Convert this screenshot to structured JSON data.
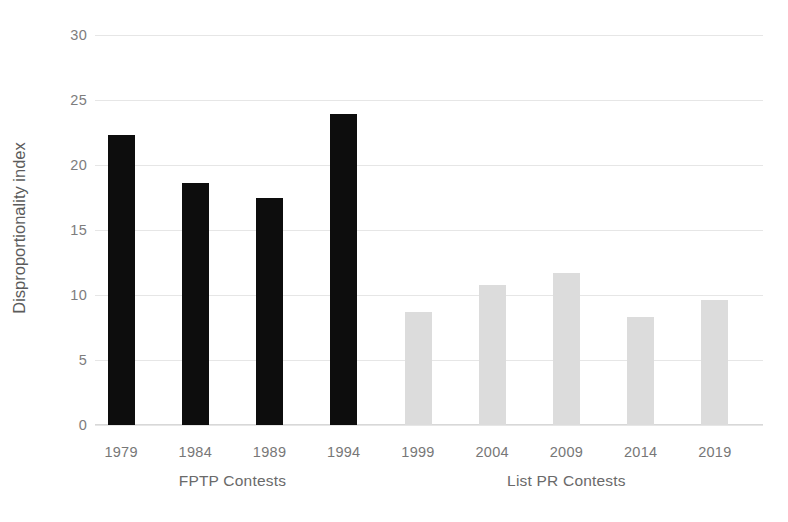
{
  "chart_data": {
    "type": "bar",
    "title": "",
    "xlabel": "",
    "ylabel": "Disproportionality index",
    "ylim": [
      0,
      30
    ],
    "ytick_labels": [
      "0",
      "5",
      "10",
      "15",
      "20",
      "25",
      "30"
    ],
    "yticks": [
      0,
      5,
      10,
      15,
      20,
      25,
      30
    ],
    "grid": true,
    "legend": "none",
    "categories": [
      "1979",
      "1984",
      "1989",
      "1994",
      "1999",
      "2004",
      "2009",
      "2014",
      "2019"
    ],
    "values": [
      22.3,
      18.6,
      17.5,
      23.9,
      8.7,
      10.8,
      11.7,
      8.3,
      9.6
    ],
    "bars": [
      {
        "category": "1979",
        "value": 22.3,
        "group": "FPTP Contests",
        "color": "#0d0d0d"
      },
      {
        "category": "1984",
        "value": 18.6,
        "group": "FPTP Contests",
        "color": "#0d0d0d"
      },
      {
        "category": "1989",
        "value": 17.5,
        "group": "FPTP Contests",
        "color": "#0d0d0d"
      },
      {
        "category": "1994",
        "value": 23.9,
        "group": "FPTP Contests",
        "color": "#0d0d0d"
      },
      {
        "category": "1999",
        "value": 8.7,
        "group": "List PR Contests",
        "color": "#dcdcdc"
      },
      {
        "category": "2004",
        "value": 10.8,
        "group": "List PR Contests",
        "color": "#dcdcdc"
      },
      {
        "category": "2009",
        "value": 11.7,
        "group": "List PR Contests",
        "color": "#dcdcdc"
      },
      {
        "category": "2014",
        "value": 8.3,
        "group": "List PR Contests",
        "color": "#dcdcdc"
      },
      {
        "category": "2019",
        "value": 9.6,
        "group": "List PR Contests",
        "color": "#dcdcdc"
      }
    ],
    "group_labels": [
      {
        "label": "FPTP Contests",
        "spans": [
          "1979",
          "1984",
          "1989",
          "1994"
        ]
      },
      {
        "label": "List PR Contests",
        "spans": [
          "1999",
          "2004",
          "2009",
          "2014",
          "2019"
        ]
      }
    ],
    "colors": {
      "fptp_bar": "#0d0d0d",
      "listpr_bar": "#dcdcdc",
      "gridline": "#e6e6e6",
      "tick_text": "#7d7d7d",
      "axis_title_text": "#5b5b5b",
      "background": "#ffffff"
    }
  }
}
